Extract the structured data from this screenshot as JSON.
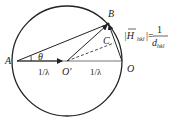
{
  "diagram": {
    "points": {
      "A": "A",
      "B": "B",
      "C": "C",
      "O": "O",
      "O_prime": "O'"
    },
    "angle_label": "θ",
    "radius_label_left": "1/λ",
    "radius_label_right": "1/λ",
    "formula": {
      "lhs": "|H",
      "lhs_sub": "hkl",
      "lhs_close": "|=",
      "numerator": "1",
      "denominator": "d",
      "denominator_sub": "hkl"
    }
  }
}
